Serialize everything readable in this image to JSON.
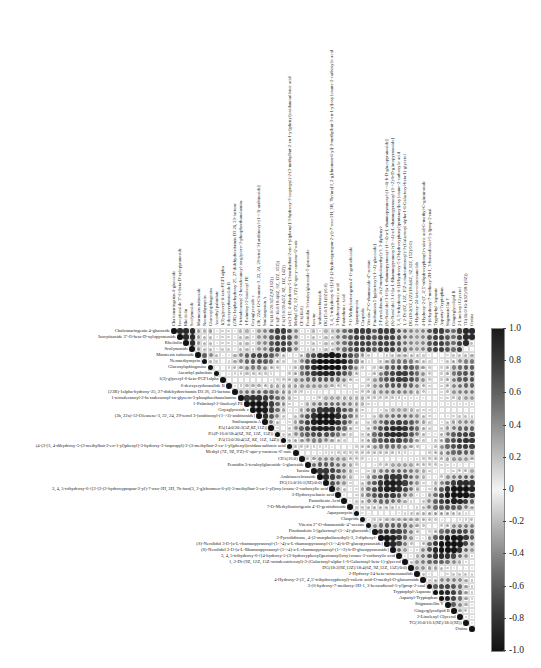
{
  "chart_data": {
    "type": "heatmap",
    "subtype": "correlation-matrix-upper-triangle-circles",
    "title": "",
    "colorbar": {
      "min": -1.0,
      "max": 1.0,
      "ticks": [
        "1.0",
        "0.8",
        "0.6",
        "0.4",
        "0.2",
        "0",
        "-0.2",
        "-0.4",
        "-0.6",
        "-0.8",
        "-1.0"
      ],
      "colors": {
        "positive": "#1a1a1a",
        "zero": "#f4f4f4",
        "negative": "#111111"
      }
    },
    "variables": [
      "Chalconaringenin 4-glucoside",
      "Isocytisoside 3''-O-beta-D-xylopyranoside",
      "Rheifolin",
      "Scolymoside",
      "Marmesin rutinoside",
      "Neomethymycin",
      "Glucosylsphingosine",
      "Ascorbyl palmitate",
      "1(3)-glyceryl-6-keto-PGF1alpha",
      "6-deoxyerythronolide B",
      "(23R)-1alpha-hydroxy-25, 27-didehydrovitamin D3 26, 23-lactone",
      "1-tetradecanoyl-2-hexadecanoyl-sn-glycero-3-phosphoethanolamine",
      "1-Palmitoyl-2-linoleoyl PE",
      "Goyaglycoside c",
      "(3b, 22a)-12-Oleanene-3, 22, 24, 29-tetrol 3-[arabinosyl-(1->3)-arabinoside]",
      "Smilasaponin A",
      "PA(14:0/20:3(5Z,8Z,11Z))",
      "PA(P-16:0/18:4(6Z, 9Z, 12Z, 15Z))",
      "PA(13:0/20:4(5Z, 8Z, 11Z, 14Z))",
      "(4-(3-[3, 4-dihydroxy-5-(3-methylbut-2-en-1-yl)phenyl]-3-hydroxy-3-isopropyl)-2-(3-methylbut-2-en-1-yl)phenyl)oxidanesulfonic acid",
      "Methyl (7Z, 9Z, 9'Z)-6'-apo-y-carotene-6'-oate",
      "CPA(16:0)",
      "Peonidin 3-feruloylglucoside-5-glucoside",
      "Isosine",
      "Arabinoerebrasside",
      "DG(15:0/16:1(9Z)/0:0)",
      "3, 4, 5-trihydroxy-6-{[2-[2-(2-hydroxypropan-2-yl)-7-oxo-2H, 3H, 7h-furo[3, 2-g]chromen-6-yl]-3-methylbut-3-en-1-yl]oxy}oxane-2-carboxylic acid",
      "3-Hydroxysebacic acid",
      "Pantothenic Acid",
      "7-O-Methylisotorigenin 4'-O-gentiobioside",
      "Aquayamycin",
      "Clasprida",
      "Vitexin 2''-O-rhamnoside-4''-acetate",
      "Pinobanksin 5-[galactosyl-(1->4)-glucoside]",
      "2-Pyrrolidinone, 4-(2-morpholinoethyl)-3, 3-diphenyl-",
      "(S)-Nerolidol 3-O-[a-L-rhamnopyranosyl-(1->4)-a-L-rhamnopyranosyl-(1->4)-b-D-glucopyranoside]",
      "(S)-Nerolidol 3-O-[a-L-Rhamnopyranosyl-(1->4)-a-L-rhamnopyranosyl-(1->2)-b-D-glucopyranoside]",
      "3, 4, 5-trihydroxy-6-{[4-hydroxy-5-(3-hydroxyphenyl)pentanoyl]oxy}oxane-2-carboxylic acid",
      "1, 2-Di-(9Z, 12Z, 15Z-octadecatrienoyl)-3-(Galactosyl-alpha-1-6-Galactosyl-beta-1)-glycerol",
      "DG(18:2(9Z,12Z)/18:4(6Z, 9Z,12Z, 15Z)/0:0)",
      "2-Hydroxy-24-keto-octacosanolide",
      "4-Hydroxy-2-(3', 4',5'-trihydroxyphenyl)-valeric acid-O-methyl-O-glucuronide",
      "3-(6-hydroxy-7-methoxy-2H-1, 3-benzodioxol-5-yl)prop-2-enal",
      "Tryptophyl-Asparate",
      "Aspartyl-Tryptophan",
      "Stigmastellin Y",
      "Gingerglycolipid B",
      "2-Linoleoyl Glycerol",
      "TG(16:0/16:1(9Z)/18:1(9Z))",
      "Oxtine"
    ],
    "values_note": "Upper-triangular Pearson correlation matrix; each row string lists correlations from the diagonal (1.0) rightwards, estimated from circle shade/size",
    "matrix_upper": [
      "1 .9 .9 .9 .4 .3 .4 -.1 .2 .2 .1 .3 .3 .2 .4 .5 .7 .8 .8 .7 .5 -.1 .2 .3 .2 .3 .3 .5 .6 .7 .8 .8 .8 .7 .8 .8 .8 .7 .6 .5 .4 .5 .7 .8 .8 .7 .6 .8 .9 .9 .9",
      "1 .9 .9 .4 .3 .3 -.1 .2 .2 .1 .3 .3 .2 .4 .5 .7 .8 .8 .7 .5 -.1 .2 .3 .2 .3 .3 .5 .6 .7 .8 .8 .8 .7 .8 .8 .8 .7 .6 .5 .4 .5 .7 .8 .8 .7 .6 .8 .9 .9",
      "1 .9 .4 .3 .3 -.1 .2 .2 .1 .3 .3 .2 .4 .5 .7 .8 .8 .7 .5 -.1 .2 .3 .2 .3 .3 .5 .6 .7 .8 .8 .8 .7 .8 .8 .8 .7 .6 .5 .4 .5 .7 .8 .8 .7 .6 .8 .9",
      "1 .4 .3 .3 -.1 .2 .2 .1 .3 .3 .2 .4 .5 .7 .8 .8 .7 .5 -.1 .2 .3 .2 .3 .3 .5 .6 .7 .8 .8 .8 .7 .8 .8 .8 .7 .6 .5 .4 .5 .7 .8 .8 .7 .6 .8"
    ]
  },
  "layout": {
    "matrix_left": 171,
    "matrix_top": 328,
    "cell": 6.08
  }
}
